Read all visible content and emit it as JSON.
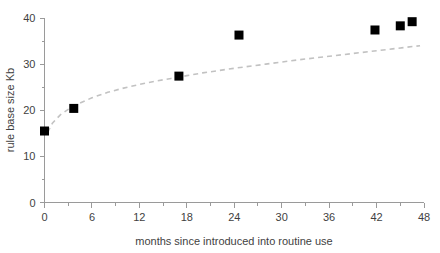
{
  "chart_data": {
    "type": "scatter",
    "title": "",
    "xlabel": "months since introduced into routine use",
    "ylabel": "rule base size Kb",
    "xlim": [
      0,
      48
    ],
    "ylim": [
      0,
      40
    ],
    "xticks": [
      0,
      6,
      12,
      18,
      24,
      30,
      36,
      42,
      48
    ],
    "xtick_labels": [
      "0",
      "6",
      "12",
      "18",
      "24",
      "30",
      "36",
      "42",
      "48"
    ],
    "yticks": [
      0,
      10,
      20,
      30,
      40
    ],
    "ytick_labels": [
      "0",
      "10",
      "20",
      "30",
      "40"
    ],
    "x_minor_tick_step": 3,
    "y_minor_tick_step": 5,
    "grid": false,
    "legend": "none",
    "marker_style": "filled-square",
    "marker_color": "#000000",
    "series": [
      {
        "name": "rule base size",
        "points": [
          {
            "x": 0.0,
            "y": 15.5
          },
          {
            "x": 3.7,
            "y": 20.4
          },
          {
            "x": 17.0,
            "y": 27.4
          },
          {
            "x": 24.6,
            "y": 36.3
          },
          {
            "x": 41.8,
            "y": 37.4
          },
          {
            "x": 45.0,
            "y": 38.3
          },
          {
            "x": 46.5,
            "y": 39.2
          }
        ]
      }
    ],
    "trendline": {
      "type": "logarithmic",
      "style": "dashed",
      "color": "#c2c2c2",
      "points": [
        {
          "x": 0.4,
          "y": 15.2
        },
        {
          "x": 1.0,
          "y": 17.2
        },
        {
          "x": 2.0,
          "y": 19.0
        },
        {
          "x": 3.0,
          "y": 20.2
        },
        {
          "x": 4.0,
          "y": 21.2
        },
        {
          "x": 6.0,
          "y": 22.7
        },
        {
          "x": 8.0,
          "y": 23.9
        },
        {
          "x": 10.0,
          "y": 24.8
        },
        {
          "x": 12.0,
          "y": 25.6
        },
        {
          "x": 14.0,
          "y": 26.3
        },
        {
          "x": 16.0,
          "y": 26.9
        },
        {
          "x": 18.0,
          "y": 27.5
        },
        {
          "x": 20.0,
          "y": 28.1
        },
        {
          "x": 24.0,
          "y": 29.1
        },
        {
          "x": 28.0,
          "y": 30.0
        },
        {
          "x": 32.0,
          "y": 30.9
        },
        {
          "x": 36.0,
          "y": 31.7
        },
        {
          "x": 40.0,
          "y": 32.5
        },
        {
          "x": 44.0,
          "y": 33.3
        },
        {
          "x": 47.5,
          "y": 34.0
        }
      ]
    }
  },
  "axes": {
    "x_title": "months since introduced into routine use",
    "y_title": "rule base size Kb"
  }
}
